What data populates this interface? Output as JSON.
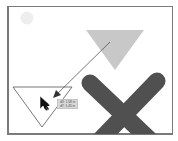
{
  "canvas": {
    "background": "#ffffff",
    "frame_border": "#7a7a7a"
  },
  "shapes": {
    "circle": {
      "color": "#eeeeee"
    },
    "gray_triangle": {
      "color": "#c8c8c8"
    },
    "outline_triangle": {
      "stroke": "#555555"
    },
    "x_shape": {
      "color": "#505050"
    },
    "drag_arrow": {
      "color": "#555555"
    }
  },
  "tooltip": {
    "dx": "dX: 1.58 in",
    "dy": "dY: 1.45 in"
  },
  "cursor": {
    "icon": "move-arrow-cursor-icon"
  }
}
